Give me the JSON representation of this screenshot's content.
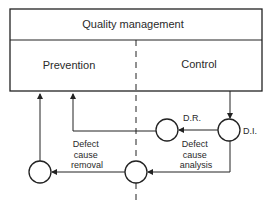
{
  "diagram": {
    "title": "Quality management",
    "left_section": "Prevention",
    "right_section": "Control",
    "nodes": {
      "di": "D.I.",
      "dr": "D.R."
    },
    "labels": {
      "analysis": [
        "Defect",
        "cause",
        "analysis"
      ],
      "removal": [
        "Defect",
        "cause",
        "removal"
      ]
    },
    "colors": {
      "stroke": "#222222",
      "text": "#2a2a2a",
      "background": "#ffffff"
    }
  }
}
